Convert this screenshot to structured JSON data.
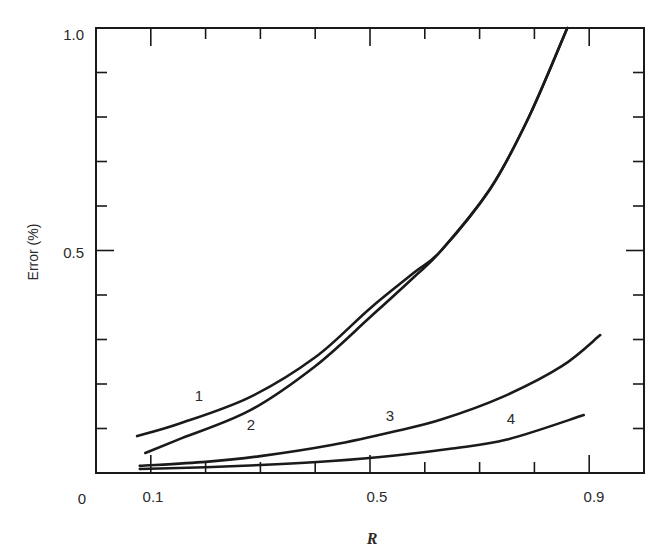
{
  "chart_data": {
    "type": "line",
    "title": "",
    "xlabel": "R",
    "ylabel": "Error (%)",
    "xlim": [
      0,
      1.0
    ],
    "ylim": [
      0,
      1.0
    ],
    "grid": false,
    "legend_position": "inline labels on curves",
    "x_tick_labels": [
      {
        "value": 0,
        "label": "0"
      },
      {
        "value": 0.1,
        "label": "0.1"
      },
      {
        "value": 0.5,
        "label": "0.5"
      },
      {
        "value": 0.9,
        "label": "0.9"
      }
    ],
    "y_tick_labels": [
      {
        "value": 0.5,
        "label": "0.5"
      },
      {
        "value": 1.0,
        "label": "1.0"
      }
    ],
    "x_minor_ticks": [
      0.1,
      0.2,
      0.3,
      0.4,
      0.5,
      0.6,
      0.7,
      0.8,
      0.9
    ],
    "y_minor_ticks": [
      0.1,
      0.2,
      0.3,
      0.4,
      0.5,
      0.6,
      0.7,
      0.8,
      0.9
    ],
    "series": [
      {
        "name": "1",
        "label_pos": [
          0.19,
          0.17
        ],
        "x": [
          0.075,
          0.15,
          0.28,
          0.4,
          0.5,
          0.58,
          0.63,
          0.72,
          0.79,
          0.86
        ],
        "y": [
          0.083,
          0.11,
          0.17,
          0.26,
          0.37,
          0.45,
          0.5,
          0.64,
          0.8,
          1.0
        ]
      },
      {
        "name": "2",
        "label_pos": [
          0.28,
          0.11
        ],
        "x": [
          0.09,
          0.15,
          0.28,
          0.4,
          0.5,
          0.58,
          0.63,
          0.72,
          0.79,
          0.86
        ],
        "y": [
          0.045,
          0.075,
          0.14,
          0.24,
          0.35,
          0.44,
          0.5,
          0.64,
          0.8,
          1.0
        ]
      },
      {
        "name": "3",
        "label_pos": [
          0.53,
          0.135
        ],
        "x": [
          0.08,
          0.2,
          0.3,
          0.43,
          0.55,
          0.63,
          0.74,
          0.85,
          0.92
        ],
        "y": [
          0.016,
          0.025,
          0.038,
          0.063,
          0.095,
          0.12,
          0.17,
          0.24,
          0.31
        ]
      },
      {
        "name": "4",
        "label_pos": [
          0.755,
          0.12
        ],
        "x": [
          0.08,
          0.2,
          0.3,
          0.43,
          0.55,
          0.65,
          0.75,
          0.89
        ],
        "y": [
          0.009,
          0.013,
          0.018,
          0.027,
          0.04,
          0.055,
          0.075,
          0.13
        ]
      }
    ]
  },
  "labels": {
    "ylabel": "Error (%)",
    "xlabel": "R",
    "origin": "0",
    "x_01": "0.1",
    "x_05": "0.5",
    "x_09": "0.9",
    "y_05": "0.5",
    "y_10": "1.0",
    "series_1": "1",
    "series_2": "2",
    "series_3": "3",
    "series_4": "4"
  }
}
